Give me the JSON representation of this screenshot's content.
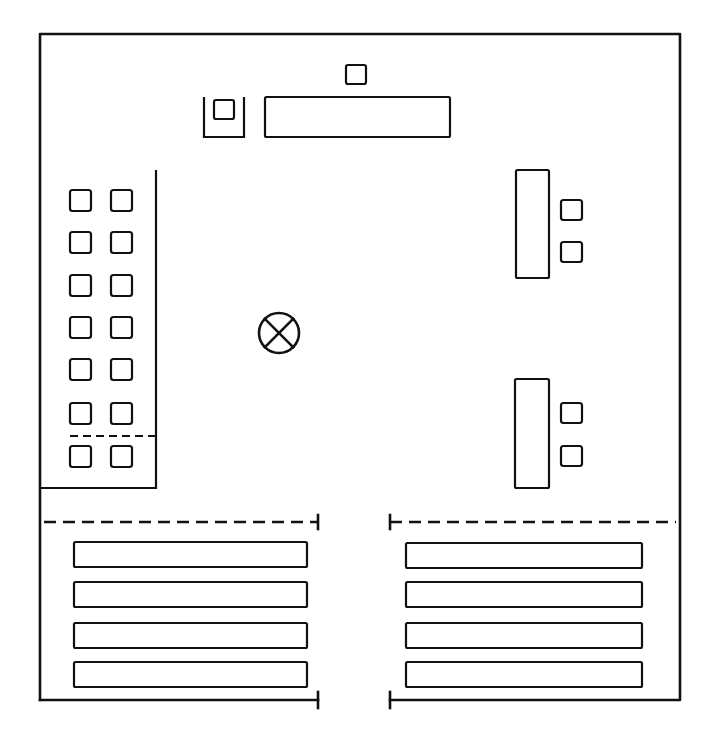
{
  "diagram": {
    "type": "floor-plan",
    "title": "",
    "colors": {
      "line": "#111111",
      "background": "#ffffff"
    },
    "outer_wall": {
      "x1": 40,
      "y1": 34,
      "x2": 680,
      "y2": 700,
      "door_gap": [
        318,
        390
      ]
    },
    "front": {
      "teacher_desk": {
        "x": 265,
        "y": 97,
        "w": 185,
        "h": 40
      },
      "teacher_chair": {
        "x": 346,
        "y": 65,
        "w": 20,
        "h": 19
      },
      "side_station": {
        "x": 204,
        "y": 97,
        "w": 40,
        "h": 40,
        "chair": {
          "x": 214,
          "y": 100,
          "w": 20,
          "h": 19
        }
      }
    },
    "left_block": {
      "partition_x": 156,
      "top_y": 170,
      "bottom_y": 488,
      "divider_y": 436,
      "columns_x": [
        70,
        111
      ],
      "rows_y": [
        190,
        232,
        275,
        317,
        359,
        403,
        446
      ],
      "seat_size": 21
    },
    "right_stations": [
      {
        "table": {
          "x": 516,
          "y": 170,
          "w": 33,
          "h": 108
        },
        "chairs_y": [
          200,
          242
        ],
        "chairs_x": 561
      },
      {
        "table": {
          "x": 515,
          "y": 379,
          "w": 34,
          "h": 109
        },
        "chairs_y": [
          403,
          446
        ],
        "chairs_x": 561
      }
    ],
    "center_marker": {
      "cx": 279,
      "cy": 333,
      "r": 20,
      "icon": "circle-cross"
    },
    "rear_rows": {
      "dashed_line_y": 522,
      "left": {
        "x": 74,
        "w": 233,
        "rows_y": [
          542,
          582,
          623,
          662
        ],
        "h": 25
      },
      "right": {
        "x": 406,
        "w": 236,
        "rows_y": [
          543,
          582,
          623,
          662
        ],
        "h": 25
      }
    },
    "labels": {
      "center_marker": "circle-cross marker",
      "teacher_desk": "front desk",
      "left_block": "left seating block",
      "rear_rows": "rear bench rows"
    }
  }
}
